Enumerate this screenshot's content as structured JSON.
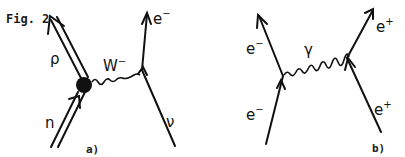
{
  "figure": {
    "title": "Fig. 2",
    "ink_color": "#111111",
    "background": "#ffffff"
  },
  "diagram_a": {
    "caption": "a)",
    "particles": {
      "proton": {
        "label": "ρ",
        "type": "double-line",
        "direction": "outgoing"
      },
      "neutron": {
        "label": "n",
        "type": "double-line",
        "direction": "incoming"
      },
      "w_boson": {
        "label": "W",
        "superscript": "−",
        "type": "wavy"
      },
      "electron": {
        "label": "e",
        "superscript": "−",
        "direction": "outgoing"
      },
      "neutrino": {
        "label": "ν",
        "direction": "incoming"
      }
    },
    "vertex_blob": "filled-circle"
  },
  "diagram_b": {
    "caption": "b)",
    "particles": {
      "electron_out": {
        "label": "e",
        "superscript": "−",
        "direction": "outgoing"
      },
      "electron_in": {
        "label": "e",
        "superscript": "−",
        "direction": "incoming"
      },
      "photon": {
        "label": "γ",
        "type": "wavy"
      },
      "positron_out": {
        "label": "e",
        "superscript": "+",
        "direction": "outgoing"
      },
      "positron_in": {
        "label": "e",
        "superscript": "+",
        "direction": "incoming"
      }
    }
  }
}
